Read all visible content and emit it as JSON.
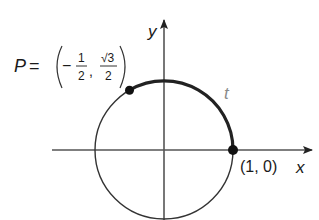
{
  "diagram": {
    "type": "unit-circle",
    "axes": {
      "x_label": "x",
      "y_label": "y"
    },
    "circle": {
      "center": [
        0,
        0
      ],
      "radius": 1
    },
    "arc": {
      "label": "t",
      "from": "(1, 0)",
      "to": "P",
      "color": "#333333"
    },
    "points": [
      {
        "name": "P",
        "label_prefix": "P =",
        "x_text": "−",
        "x_num": "1",
        "x_den": "2",
        "sep": ",",
        "y_num": "√3",
        "y_den": "2",
        "coords": [
          -0.5,
          0.866
        ]
      },
      {
        "name": "start",
        "label": "(1, 0)",
        "coords": [
          1,
          0
        ]
      }
    ],
    "colors": {
      "line": "#2b2b2b",
      "arc": "#222222",
      "axis": "#555555",
      "t_label": "#8a8a8a"
    }
  }
}
